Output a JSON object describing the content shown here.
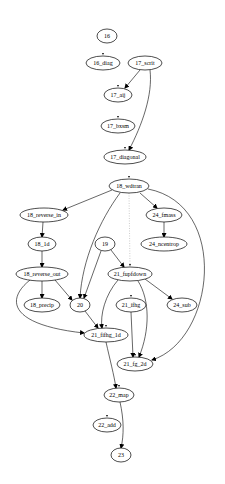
{
  "diagram": {
    "type": "directed-graph",
    "nodes": [
      {
        "id": "16",
        "label": "16",
        "x": 107,
        "y": 36,
        "rx": 10,
        "ry": 7,
        "mark": false
      },
      {
        "id": "16_diag",
        "label": "16_diag",
        "x": 103,
        "y": 63,
        "rx": 17,
        "ry": 7,
        "mark": true
      },
      {
        "id": "17_scrit",
        "label": "17_scrit",
        "x": 145,
        "y": 63,
        "rx": 17,
        "ry": 7,
        "mark": false
      },
      {
        "id": "17_aij",
        "label": "17_aij",
        "x": 118,
        "y": 95,
        "rx": 14,
        "ry": 7,
        "mark": true
      },
      {
        "id": "17_bxsm",
        "label": "17_bxsm",
        "x": 118,
        "y": 126,
        "rx": 17,
        "ry": 7,
        "mark": true
      },
      {
        "id": "17_diagonal",
        "label": "17_diagonal",
        "x": 125,
        "y": 157,
        "rx": 21,
        "ry": 7,
        "mark": true
      },
      {
        "id": "18_wdtran",
        "label": "18_wdtran",
        "x": 129,
        "y": 186,
        "rx": 20,
        "ry": 7,
        "mark": true
      },
      {
        "id": "18_reverse_in",
        "label": "18_reverse_in",
        "x": 44,
        "y": 215,
        "rx": 24,
        "ry": 7,
        "mark": false
      },
      {
        "id": "24_fmass",
        "label": "24_fmass",
        "x": 164,
        "y": 215,
        "rx": 18,
        "ry": 7,
        "mark": false
      },
      {
        "id": "18_1d",
        "label": "18_1d",
        "x": 42,
        "y": 244,
        "rx": 14,
        "ry": 7,
        "mark": false
      },
      {
        "id": "19",
        "label": "19",
        "x": 105,
        "y": 244,
        "rx": 10,
        "ry": 7,
        "mark": false
      },
      {
        "id": "24_ncentrop",
        "label": "24_ncentrop",
        "x": 164,
        "y": 244,
        "rx": 23,
        "ry": 7,
        "mark": false
      },
      {
        "id": "18_reverse_out",
        "label": "18_reverse_out",
        "x": 42,
        "y": 274,
        "rx": 26,
        "ry": 7,
        "mark": false
      },
      {
        "id": "21_fupfdown",
        "label": "21_fupfdown",
        "x": 130,
        "y": 274,
        "rx": 22,
        "ry": 7,
        "mark": true
      },
      {
        "id": "18_precip",
        "label": "18_precip",
        "x": 42,
        "y": 305,
        "rx": 18,
        "ry": 7,
        "mark": false
      },
      {
        "id": "20",
        "label": "20",
        "x": 80,
        "y": 305,
        "rx": 10,
        "ry": 7,
        "mark": false
      },
      {
        "id": "21_ifhg",
        "label": "21_ifhg",
        "x": 131,
        "y": 305,
        "rx": 15,
        "ry": 7,
        "mark": true
      },
      {
        "id": "24_sub",
        "label": "24_sub",
        "x": 182,
        "y": 305,
        "rx": 15,
        "ry": 7,
        "mark": false
      },
      {
        "id": "21_fifhg_1d",
        "label": "21_fifhg_1d",
        "x": 106,
        "y": 335,
        "rx": 22,
        "ry": 7,
        "mark": true
      },
      {
        "id": "21_fg_2d",
        "label": "21_fg_2d",
        "x": 135,
        "y": 364,
        "rx": 18,
        "ry": 7,
        "mark": true
      },
      {
        "id": "22_map",
        "label": "22_map",
        "x": 119,
        "y": 395,
        "rx": 15,
        "ry": 7,
        "mark": true
      },
      {
        "id": "22_add",
        "label": "22_add",
        "x": 107,
        "y": 425,
        "rx": 14,
        "ry": 7,
        "mark": true
      },
      {
        "id": "23",
        "label": "23",
        "x": 121,
        "y": 455,
        "rx": 10,
        "ry": 7,
        "mark": true
      }
    ],
    "edges": [
      {
        "from": "17_scrit",
        "to": "17_aij",
        "d": "M140,70 L125,88",
        "style": "solid"
      },
      {
        "from": "17_scrit",
        "to": "17_diagonal",
        "d": "M150,70 C153,95 142,125 129,150",
        "style": "solid"
      },
      {
        "from": "18_wdtran",
        "to": "18_reverse_in",
        "d": "M112,190 L63,210",
        "style": "solid"
      },
      {
        "from": "18_wdtran",
        "to": "24_fmass",
        "d": "M140,193 L157,208",
        "style": "solid"
      },
      {
        "from": "18_wdtran",
        "to": "20",
        "d": "M120,193 C100,220 82,260 80,298",
        "style": "solid"
      },
      {
        "from": "18_wdtran",
        "to": "21_fupfdown",
        "d": "M129,193 L130,267",
        "style": "dotted"
      },
      {
        "from": "18_wdtran",
        "to": "21_fg_2d",
        "d": "M148,189 C230,205 215,340 152,360",
        "style": "solid"
      },
      {
        "from": "18_reverse_in",
        "to": "18_1d",
        "d": "M43,222 L42,237",
        "style": "solid"
      },
      {
        "from": "24_fmass",
        "to": "24_ncentrop",
        "d": "M164,222 L164,237",
        "style": "solid"
      },
      {
        "from": "18_1d",
        "to": "18_reverse_out",
        "d": "M42,251 L42,267",
        "style": "solid"
      },
      {
        "from": "19",
        "to": "20",
        "d": "M101,251 L84,298",
        "style": "solid"
      },
      {
        "from": "19",
        "to": "21_fupfdown",
        "d": "M111,250 L124,267",
        "style": "solid"
      },
      {
        "from": "18_reverse_out",
        "to": "18_precip",
        "d": "M42,281 L42,298",
        "style": "solid"
      },
      {
        "from": "18_reverse_out",
        "to": "20",
        "d": "M55,280 L72,300",
        "style": "solid"
      },
      {
        "from": "18_reverse_out",
        "to": "21_fifhg_1d",
        "d": "M30,280 C5,300 10,325 84,333",
        "style": "solid"
      },
      {
        "from": "21_fupfdown",
        "to": "21_fifhg_1d",
        "d": "M118,280 C105,295 100,315 102,328",
        "style": "solid"
      },
      {
        "from": "21_fupfdown",
        "to": "24_sub",
        "d": "M145,279 L172,299",
        "style": "solid"
      },
      {
        "from": "21_fupfdown",
        "to": "21_fg_2d",
        "d": "M138,281 C150,300 150,330 139,357",
        "style": "solid"
      },
      {
        "from": "20",
        "to": "21_fifhg_1d",
        "d": "M85,311 L98,328",
        "style": "solid"
      },
      {
        "from": "21_ifhg",
        "to": "21_fg_2d",
        "d": "M131,312 L133,357",
        "style": "solid"
      },
      {
        "from": "21_fifhg_1d",
        "to": "22_map",
        "d": "M106,342 C110,360 114,375 116,388",
        "style": "solid"
      },
      {
        "from": "22_map",
        "to": "23",
        "d": "M120,402 C124,420 124,435 121,448",
        "style": "solid"
      }
    ]
  }
}
